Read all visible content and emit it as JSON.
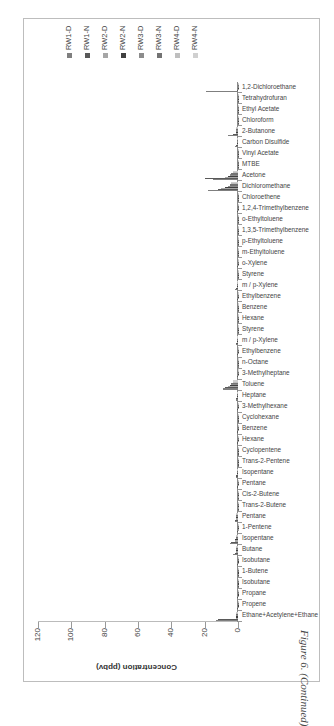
{
  "caption": "Figure 6. (Continued)",
  "chart_data": {
    "type": "bar",
    "orientation": "rotated -90deg (vertical bars shown sideways)",
    "title": "",
    "xlabel": "",
    "ylabel": "Concentration (ppbv)",
    "ylim": [
      0,
      120
    ],
    "yticks": [
      "0",
      "20",
      "40",
      "60",
      "80",
      "100",
      "120"
    ],
    "grid": false,
    "legend_position": "right",
    "categories": [
      "Ethane+Acetylene+Ethane",
      "Propene",
      "Propane",
      "Isobutane",
      "1-Butene",
      "Isobutane",
      "Butane",
      "Isopentane",
      "1-Pentene",
      "Pentane",
      "Trans-2-Butene",
      "Cis-2-Butene",
      "Pentane",
      "Isopentane",
      "Trans-2-Pentene",
      "Cyclopentene",
      "Hexane",
      "Benzene",
      "Cyclohexane",
      "3-Methylhexane",
      "Heptane",
      "Toluene",
      "3-Methylheptane",
      "n-Octane",
      "Ethylbenzene",
      "m / p-Xylene",
      "Styrene",
      "Hexane",
      "Benzene",
      "Ethylbenzene",
      "m / p-Xylene",
      "Styrene",
      "o-Xylene",
      "m-Ethyltoluene",
      "p-Ethyltoluene",
      "1,3,5-Trimethylbenzene",
      "o-Ethyltoluene",
      "1,2,4-Trimethylbenzene",
      "Chloroethene",
      "Dichloromethane",
      "Acetone",
      "MTBE",
      "Vinyl Acetate",
      "Carbon Disulfide",
      "2-Butanone",
      "Chloroform",
      "Ethyl Acetate",
      "Tetrahydrofuran",
      "1,2-Dichloroethane"
    ],
    "series": [
      {
        "name": "RW1-D",
        "color": "#7f7f7f",
        "values": [
          13,
          0.5,
          0.5,
          0.3,
          0.2,
          0.5,
          3,
          5,
          0.5,
          2,
          0.3,
          0.2,
          0.5,
          1,
          0.2,
          0.2,
          0.5,
          0.5,
          0.3,
          0.5,
          1,
          9,
          0.5,
          0.3,
          0.5,
          1,
          0.3,
          0.3,
          0.3,
          0.5,
          2,
          0.3,
          0.5,
          0.3,
          0.2,
          0.3,
          0.2,
          0.5,
          0.2,
          18,
          15,
          0.2,
          0.2,
          2,
          6,
          0.2,
          0.2,
          0.2,
          19
        ]
      },
      {
        "name": "RW1-N",
        "color": "#595959",
        "values": [
          12,
          0.5,
          0.5,
          0.3,
          0.2,
          0.5,
          2,
          4,
          0.5,
          2,
          0.3,
          0.2,
          0.5,
          1,
          0.2,
          0.2,
          0.5,
          0.5,
          0.3,
          0.5,
          1,
          8,
          0.5,
          0.3,
          0.5,
          1,
          0.3,
          0.3,
          0.3,
          0.5,
          1.5,
          0.3,
          0.5,
          0.3,
          0.2,
          0.3,
          0.2,
          0.5,
          0.2,
          12,
          20,
          0.2,
          0.2,
          1,
          3,
          0.2,
          0.2,
          0.2,
          0.5
        ]
      },
      {
        "name": "RW2-D",
        "color": "#a6a6a6",
        "values": [
          1,
          0.3,
          0.3,
          0.2,
          0.1,
          0.3,
          1,
          2,
          0.2,
          1,
          0.1,
          0.1,
          0.3,
          0.5,
          0.1,
          0.1,
          0.3,
          0.3,
          0.2,
          0.3,
          0.5,
          6,
          0.3,
          0.2,
          0.3,
          0.5,
          0.2,
          0.2,
          0.2,
          0.3,
          0.5,
          0.2,
          0.3,
          0.2,
          0.1,
          0.2,
          0.1,
          0.3,
          0.1,
          10,
          8,
          0.1,
          0.1,
          0.5,
          1,
          0.1,
          0.1,
          0.1,
          0.2
        ]
      },
      {
        "name": "RW2-N",
        "color": "#404040",
        "values": [
          1,
          0.3,
          0.3,
          0.2,
          0.1,
          0.3,
          1,
          2,
          0.2,
          1,
          0.1,
          0.1,
          0.3,
          0.5,
          0.1,
          0.1,
          0.3,
          0.3,
          0.2,
          0.3,
          0.5,
          5,
          0.3,
          0.2,
          0.3,
          0.5,
          0.2,
          0.2,
          0.2,
          0.3,
          0.5,
          0.2,
          0.3,
          0.2,
          0.1,
          0.2,
          0.1,
          0.3,
          0.1,
          8,
          6,
          0.1,
          0.1,
          0.5,
          1,
          0.1,
          0.1,
          0.1,
          0.2
        ]
      },
      {
        "name": "RW3-D",
        "color": "#8c8c8c",
        "values": [
          1,
          0.3,
          0.3,
          0.2,
          0.1,
          0.3,
          1,
          1.5,
          0.2,
          1,
          0.1,
          0.1,
          0.3,
          0.5,
          0.1,
          0.1,
          0.3,
          0.3,
          0.2,
          0.3,
          0.5,
          4,
          0.3,
          0.2,
          0.3,
          0.5,
          0.2,
          0.2,
          0.2,
          0.3,
          0.5,
          0.2,
          0.3,
          0.2,
          0.1,
          0.2,
          0.1,
          0.3,
          0.1,
          6,
          5,
          0.1,
          0.1,
          0.5,
          1,
          0.1,
          0.1,
          0.1,
          0.2
        ]
      },
      {
        "name": "RW3-N",
        "color": "#737373",
        "values": [
          1,
          0.3,
          0.3,
          0.2,
          0.1,
          0.3,
          1,
          1.5,
          0.2,
          1,
          0.1,
          0.1,
          0.3,
          0.5,
          0.1,
          0.1,
          0.3,
          0.3,
          0.2,
          0.3,
          0.5,
          4,
          0.3,
          0.2,
          0.3,
          0.5,
          0.2,
          0.2,
          0.2,
          0.3,
          0.5,
          0.2,
          0.3,
          0.2,
          0.1,
          0.2,
          0.1,
          0.3,
          0.1,
          5,
          4,
          0.1,
          0.1,
          0.5,
          1,
          0.1,
          0.1,
          0.1,
          0.2
        ]
      },
      {
        "name": "RW4-D",
        "color": "#bfbfbf",
        "values": [
          1,
          0.3,
          0.3,
          0.2,
          0.1,
          0.3,
          1,
          1.5,
          0.2,
          1,
          0.1,
          0.1,
          0.3,
          0.5,
          0.1,
          0.1,
          0.3,
          0.3,
          0.2,
          0.3,
          0.5,
          3,
          0.3,
          0.2,
          0.3,
          0.5,
          0.2,
          0.2,
          0.2,
          0.3,
          0.5,
          0.2,
          0.3,
          0.2,
          0.1,
          0.2,
          0.1,
          0.3,
          0.1,
          4,
          3,
          0.1,
          0.1,
          0.5,
          1,
          0.1,
          0.1,
          0.1,
          0.2
        ]
      },
      {
        "name": "RW4-N",
        "color": "#d0d0d0",
        "values": [
          1,
          0.3,
          0.3,
          0.2,
          0.1,
          0.3,
          1,
          1.5,
          0.2,
          1,
          0.1,
          0.1,
          0.3,
          0.5,
          0.1,
          0.1,
          0.3,
          0.3,
          0.2,
          0.3,
          0.5,
          3,
          0.3,
          0.2,
          0.3,
          0.5,
          0.2,
          0.2,
          0.2,
          0.3,
          0.5,
          0.2,
          0.3,
          0.2,
          0.1,
          0.2,
          0.1,
          0.3,
          0.1,
          4,
          3,
          0.1,
          0.1,
          0.5,
          1,
          0.1,
          0.1,
          0.1,
          0.2
        ]
      }
    ]
  }
}
